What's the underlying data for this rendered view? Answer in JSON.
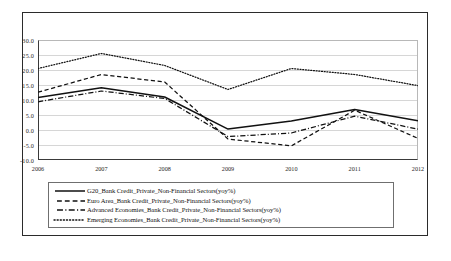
{
  "chart_data": {
    "type": "line",
    "title": "",
    "xlabel": "",
    "ylabel": "",
    "categories": [
      "2006",
      "2007",
      "2008",
      "2009",
      "2010",
      "2011",
      "2012"
    ],
    "x": [
      2006,
      2007,
      2008,
      2009,
      2010,
      2011,
      2012
    ],
    "ylim": [
      -10.0,
      30.0
    ],
    "yticks": [
      "30.0",
      "25.0",
      "20.0",
      "15.0",
      "10.0",
      "5.0",
      "0.0",
      "-5.0",
      "-10.0"
    ],
    "ytick_values": [
      30.0,
      25.0,
      20.0,
      15.0,
      10.0,
      5.0,
      0.0,
      -5.0,
      -10.0
    ],
    "grid": true,
    "legend_position": "bottom",
    "series": [
      {
        "name": "G20_Bank Credit_Private_Non-Financial Sectors(yoy%)",
        "style": "solid",
        "color": "#111111",
        "values": [
          10.8,
          14.1,
          11.0,
          0.3,
          3.0,
          6.8,
          3.1
        ]
      },
      {
        "name": "Euro Area_Bank Credit_Private_Non-Financial Sectors(yoy%)",
        "style": "dashed",
        "color": "#111111",
        "values": [
          12.6,
          18.5,
          16.0,
          -3.0,
          -5.3,
          6.6,
          -2.8
        ]
      },
      {
        "name": "Advanced Economies_Bank Credit_Private_Non-Financial Sectors(yoy%)",
        "style": "dashdot",
        "color": "#111111",
        "values": [
          9.4,
          13.0,
          10.5,
          -2.2,
          -1.0,
          4.6,
          0.3
        ]
      },
      {
        "name": "Emerging Economies_Bank Credit_Private_Non-Financial Sectors(yoy%)",
        "style": "dotted",
        "color": "#111111",
        "values": [
          20.5,
          25.5,
          21.5,
          13.5,
          20.5,
          18.5,
          14.8
        ]
      }
    ]
  },
  "legend": {
    "items": [
      {
        "label": "G20_Bank Credit_Private_Non-Financial Sectors(yoy%)",
        "style": "solid"
      },
      {
        "label": "Euro Area_Bank Credit_Private_Non-Financial Sectors(yoy%)",
        "style": "dashed"
      },
      {
        "label": "Advanced Economies_Bank Credit_Private_Non-Financial Sectors(yoy%)",
        "style": "dashdot"
      },
      {
        "label": "Emerging Economies_Bank Credit_Private_Non-Financial Sectors(yoy%)",
        "style": "dotted"
      }
    ]
  },
  "caption": {
    "text": ""
  }
}
